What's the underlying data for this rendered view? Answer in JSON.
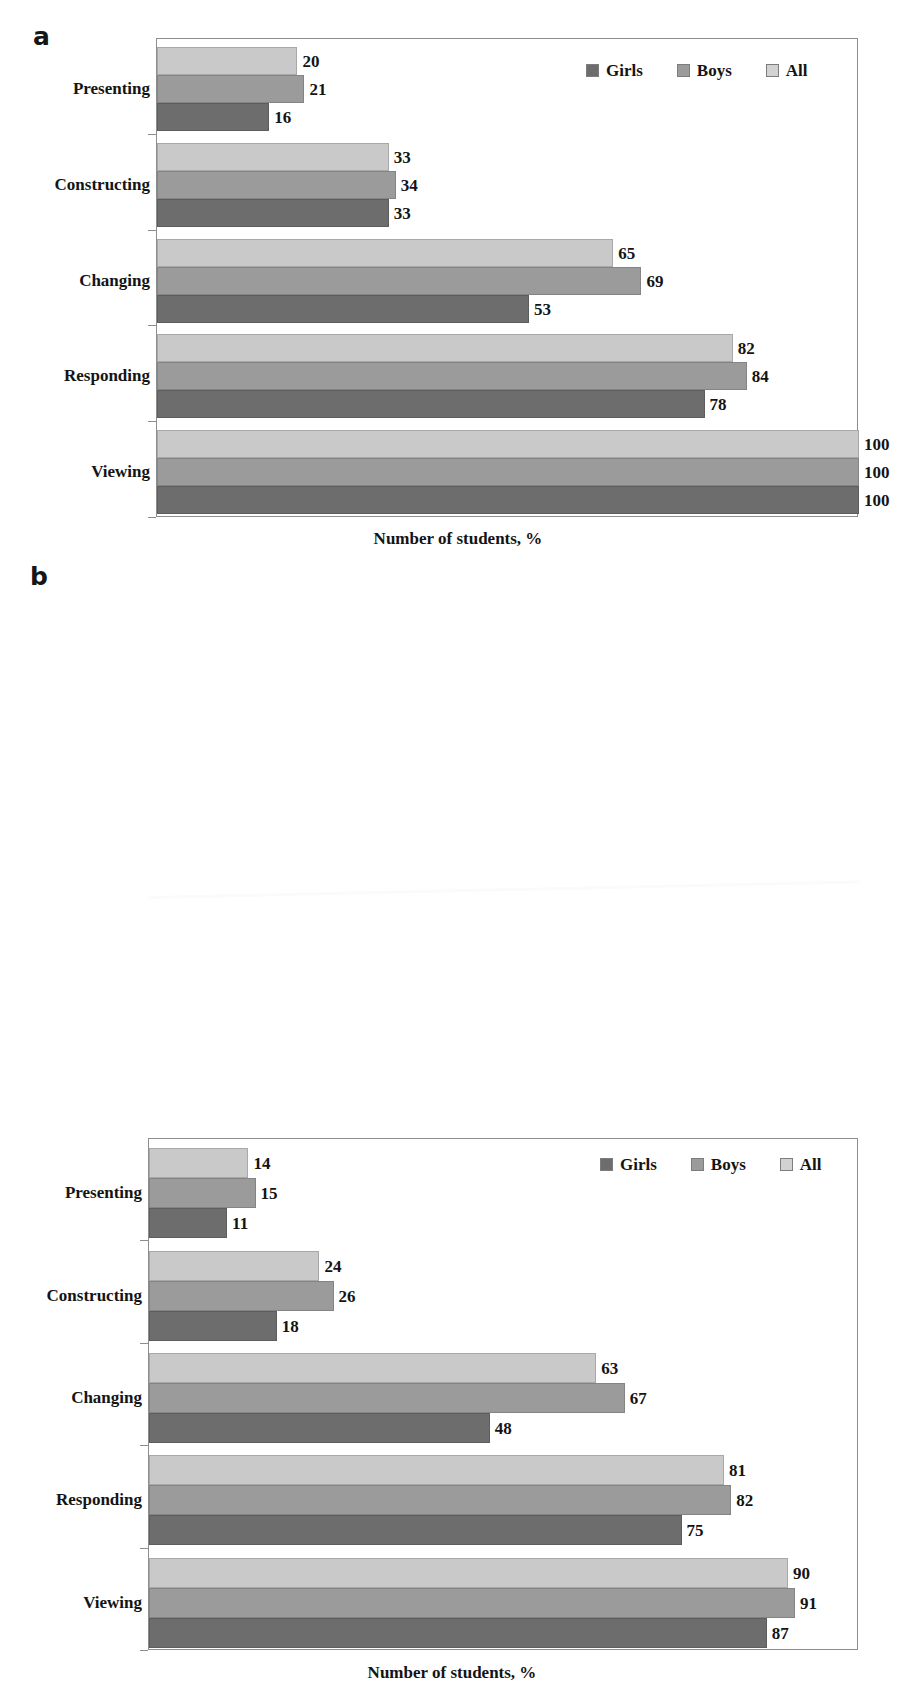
{
  "figure": {
    "panels": [
      {
        "letter": "a",
        "xlabel": "Number of students, %"
      },
      {
        "letter": "b",
        "xlabel": "Number of students, %"
      }
    ]
  },
  "legend": {
    "position": "top-right",
    "items": [
      {
        "label": "Girls",
        "color": "#6d6d6d"
      },
      {
        "label": "Boys",
        "color": "#9b9b9b"
      },
      {
        "label": "All",
        "color": "#d2d2d2"
      }
    ]
  },
  "colors": {
    "girls": "#6d6d6d",
    "boys": "#9b9b9b",
    "all": "#c9c9c9",
    "frame": "#8d8d8d",
    "text": "#141414",
    "background": "#ffffff"
  },
  "chart_data": [
    {
      "type": "bar",
      "orientation": "horizontal",
      "panel": "a",
      "title": "",
      "xlabel": "Number of students, %",
      "ylabel": "",
      "xlim": [
        0,
        100
      ],
      "grid": false,
      "legend_position": "top-right",
      "categories": [
        "Presenting",
        "Constructing",
        "Changing",
        "Responding",
        "Viewing"
      ],
      "series": [
        {
          "name": "All",
          "values": [
            20,
            33,
            65,
            82,
            100
          ]
        },
        {
          "name": "Boys",
          "values": [
            21,
            34,
            69,
            84,
            100
          ]
        },
        {
          "name": "Girls",
          "values": [
            16,
            33,
            53,
            78,
            100
          ]
        }
      ]
    },
    {
      "type": "bar",
      "orientation": "horizontal",
      "panel": "b",
      "title": "",
      "xlabel": "Number of students, %",
      "ylabel": "",
      "xlim": [
        0,
        100
      ],
      "grid": false,
      "legend_position": "top-right",
      "categories": [
        "Presenting",
        "Constructing",
        "Changing",
        "Responding",
        "Viewing"
      ],
      "series": [
        {
          "name": "All",
          "values": [
            14,
            24,
            63,
            81,
            90
          ]
        },
        {
          "name": "Boys",
          "values": [
            15,
            26,
            67,
            82,
            91
          ]
        },
        {
          "name": "Girls",
          "values": [
            11,
            18,
            48,
            75,
            87
          ]
        }
      ]
    }
  ]
}
